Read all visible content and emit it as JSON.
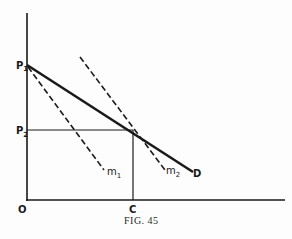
{
  "figure": {
    "caption": "Fig. 45",
    "caption_display": "FIG. 45",
    "axes": {
      "origin_label": "O",
      "x_point_label": "C"
    },
    "labels": {
      "p1": "P",
      "p1_sub": "1",
      "p2": "P",
      "p2_sub": "2",
      "m1": "m",
      "m1_sub": "1",
      "m2": "m",
      "m2_sub": "2",
      "d": "D"
    },
    "lines": [
      {
        "name": "D",
        "style": "solid",
        "description": "demand curve from P1 descending to D"
      },
      {
        "name": "m1",
        "style": "dashed",
        "description": "marginal line from P1"
      },
      {
        "name": "m2",
        "style": "dashed",
        "description": "parallel marginal line passing through intersection at P2/C"
      },
      {
        "name": "P2-C guides",
        "style": "solid-thin",
        "description": "horizontal from P2 and vertical from C meeting on D"
      }
    ],
    "colors": {
      "ink": "#1a1a1a",
      "paper": "#fdfdfd"
    }
  }
}
